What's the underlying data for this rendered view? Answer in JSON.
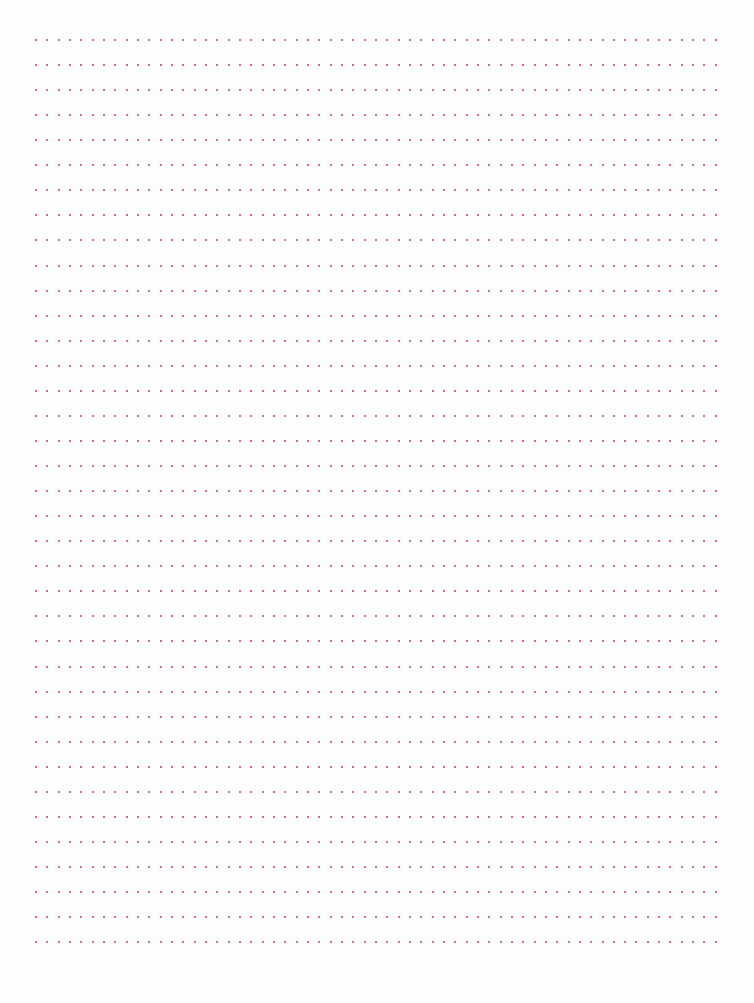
{
  "page": {
    "type": "dotted-ruled-paper",
    "background_color": "#fefefd",
    "dot_color": "#cf3a66",
    "rows": 37,
    "dots_per_row": 61,
    "first_row_y": 40,
    "row_spacing": 25.06,
    "first_dot_x": 36,
    "dot_spacing": 11.33,
    "dot_size": 2
  }
}
